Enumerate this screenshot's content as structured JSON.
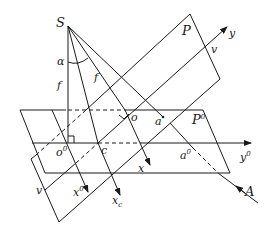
{
  "diagram": {
    "labels": {
      "S": "S",
      "P": "P",
      "y": "y",
      "v_top": "v",
      "alpha": "α",
      "f_left": "f",
      "f_right": "f",
      "o": "o",
      "a": "a",
      "P0": "P",
      "P0_sup": "0",
      "o0": "o",
      "o0_sup": "0",
      "c": "c",
      "a0": "a",
      "a0_sup": "0",
      "y0": "y",
      "y0_sup": "0",
      "x": "x",
      "x0": "x",
      "x0_sup": "0",
      "xc": "x",
      "xc_sub": "c",
      "v_bottom": "v",
      "A": "A"
    },
    "colors": {
      "line": "#1a1a1a",
      "background": "#ffffff"
    }
  }
}
